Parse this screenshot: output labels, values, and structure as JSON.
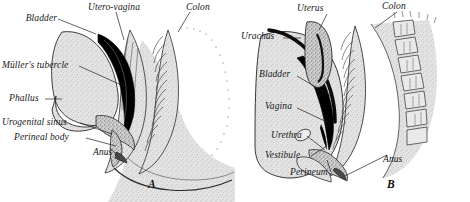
{
  "figure": {
    "background_color": "#ffffff",
    "ink_color": "#171717",
    "tissue_fill": "#d9d9d9",
    "dark_lumen": "#000000"
  },
  "panels": [
    {
      "id": "A",
      "letter": "A",
      "labels": [
        {
          "text": "Bladder",
          "x": 55,
          "y": 16,
          "align": "right"
        },
        {
          "text": "Utero-vagina",
          "x": 88,
          "y": 5,
          "align": "left"
        },
        {
          "text": "Colon",
          "x": 186,
          "y": 5,
          "align": "left"
        },
        {
          "text": "Müller's tubercle",
          "x": 2,
          "y": 62,
          "align": "left"
        },
        {
          "text": "Phallus",
          "x": 9,
          "y": 96,
          "align": "left"
        },
        {
          "text": "Urogenital sinus",
          "x": 2,
          "y": 120,
          "align": "left"
        },
        {
          "text": "Perineal body",
          "x": 12,
          "y": 135,
          "align": "left"
        },
        {
          "text": "Anus",
          "x": 93,
          "y": 150,
          "align": "left"
        }
      ]
    },
    {
      "id": "B",
      "letter": "B",
      "labels": [
        {
          "text": "Uterus",
          "x": 62,
          "y": 6,
          "align": "left"
        },
        {
          "text": "Colon",
          "x": 147,
          "y": 4,
          "align": "left"
        },
        {
          "text": "Urachus",
          "x": 6,
          "y": 34,
          "align": "left"
        },
        {
          "text": "Bladder",
          "x": 24,
          "y": 72,
          "align": "left"
        },
        {
          "text": "Vagina",
          "x": 30,
          "y": 104,
          "align": "left"
        },
        {
          "text": "Urethra",
          "x": 36,
          "y": 133,
          "align": "left"
        },
        {
          "text": "Vestibule",
          "x": 30,
          "y": 153,
          "align": "left"
        },
        {
          "text": "Perineum",
          "x": 55,
          "y": 170,
          "align": "left"
        },
        {
          "text": "Anus",
          "x": 148,
          "y": 157,
          "align": "left"
        }
      ]
    }
  ]
}
